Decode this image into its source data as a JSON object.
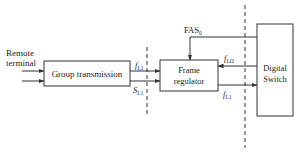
{
  "diagram": {
    "inputs": {
      "label_line1": "Remote",
      "label_line2": "terminal"
    },
    "blocks": {
      "group_transmission": "Group transmission",
      "frame_regulator_line1": "Frame",
      "frame_regulator_line2": "regulator",
      "digital_switch_line1": "Digital",
      "digital_switch_line2": "Switch"
    },
    "signals": {
      "f_l1_left": {
        "main": "f",
        "sub": "L1"
      },
      "s_l1_left": {
        "main": "S",
        "sub": "L1"
      },
      "fas": {
        "main": "FAS",
        "sub": "0"
      },
      "f_lo": {
        "main": "f",
        "sub": "LO"
      },
      "f_l1_right": {
        "main": "f",
        "sub": "L1"
      }
    },
    "colors": {
      "stroke": "#333333",
      "text": "#222222",
      "background": "#ffffff"
    }
  }
}
